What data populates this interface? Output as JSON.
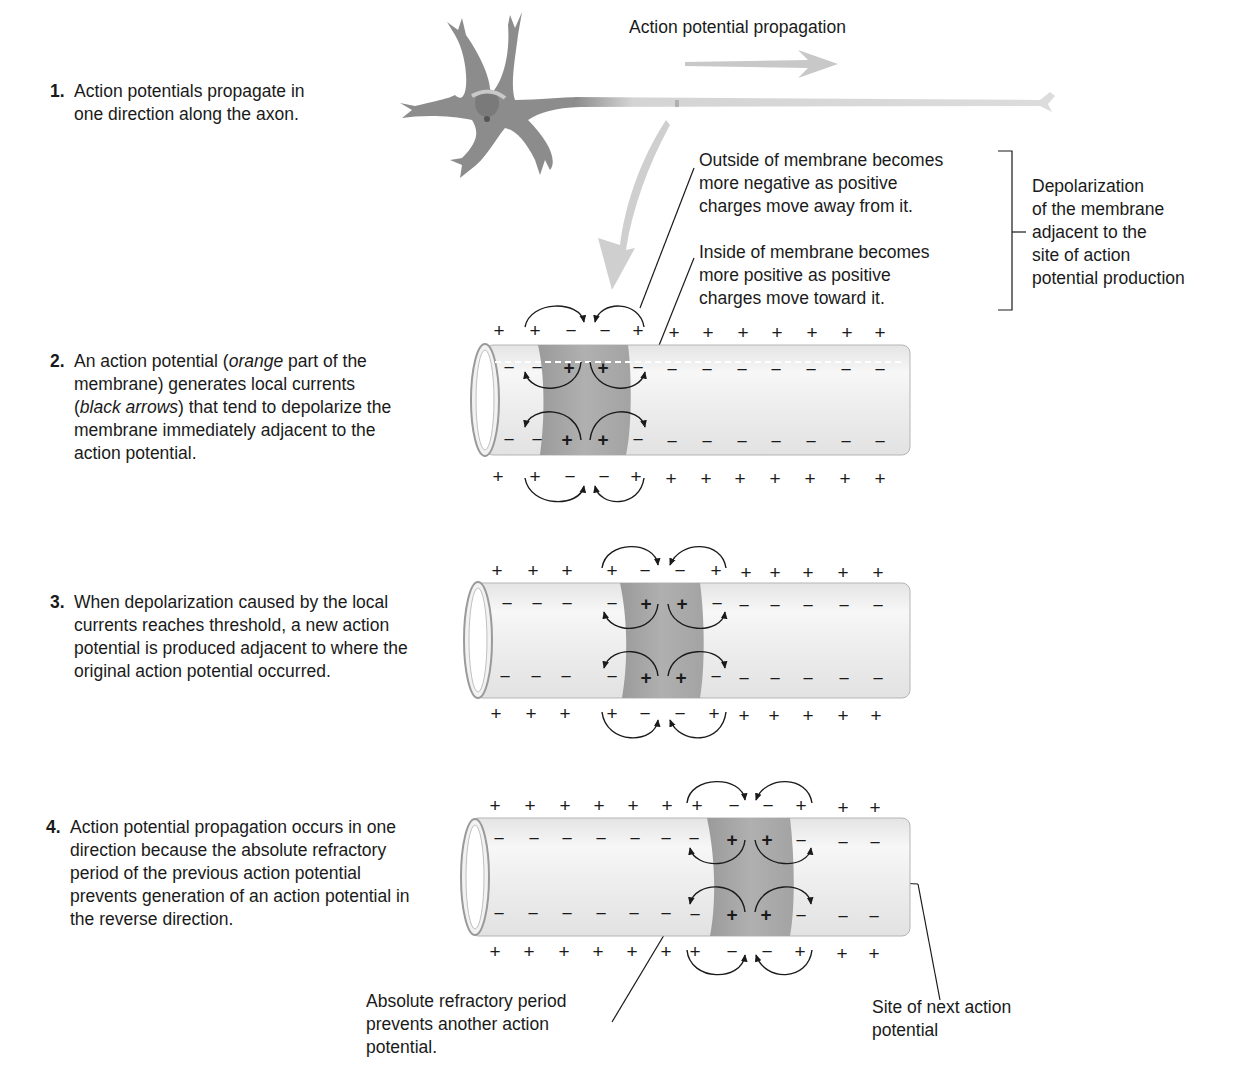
{
  "header": {
    "propagation_label": "Action potential propagation"
  },
  "steps": [
    {
      "number": "1.",
      "lines": [
        "Action potentials propagate in",
        "one direction along the axon."
      ]
    },
    {
      "number": "2.",
      "text_pre": "An action potential (",
      "em1": "orange",
      "text_mid1": " part of the membrane) generates local currents (",
      "em2": "black arrows",
      "text_post": ") that tend to depolarize the membrane immediately adjacent to the action potential."
    },
    {
      "number": "3.",
      "text": "When depolarization caused by the local currents reaches threshold, a new action potential is produced adjacent to where the original action potential occurred."
    },
    {
      "number": "4.",
      "text": "Action potential propagation occurs in one direction because the absolute refractory period of the previous action potential prevents generation of an action potential in the reverse direction."
    }
  ],
  "callouts": {
    "outside": [
      "Outside of membrane becomes",
      "more negative as positive",
      "charges move away from it."
    ],
    "inside": [
      "Inside of membrane becomes",
      "more positive as positive",
      "charges move toward it."
    ],
    "bracket_label": [
      "Depolarization",
      "of the membrane",
      "adjacent to the",
      "site of action",
      "potential production"
    ],
    "refractory": [
      "Absolute refractory period",
      "prevents another action",
      "potential."
    ],
    "next_site": [
      "Site of next action",
      "potential"
    ]
  },
  "symbols": {
    "plus": "+",
    "minus": "−"
  },
  "colors": {
    "text": "#1a1a1a",
    "neuron": "#8c8c8c",
    "axon": "#d6d6d6",
    "membrane_tube": "#ececec",
    "active_band": "#9a9a9a",
    "arrow_gray": "#c8c8c8"
  }
}
